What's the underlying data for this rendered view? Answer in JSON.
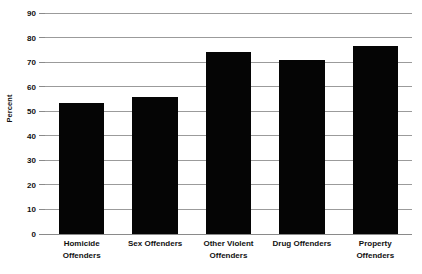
{
  "chart_data": {
    "type": "bar",
    "title": "",
    "xlabel": "",
    "ylabel": "Percent",
    "categories": [
      "Homicide Offenders",
      "Sex Offenders",
      "Other Violent Offenders",
      "Drug Offenders",
      "Property Offenders"
    ],
    "category_lines": [
      [
        "Homicide",
        "Offenders"
      ],
      [
        "Sex Offenders"
      ],
      [
        "Other Violent",
        "Offenders"
      ],
      [
        "Drug Offenders"
      ],
      [
        "Property",
        "Offenders"
      ]
    ],
    "values": [
      53.5,
      56,
      74,
      71,
      76.5
    ],
    "ylim": [
      0,
      90
    ],
    "ytick_step": 10,
    "ytick_labels": [
      "0",
      "10",
      "20",
      "30",
      "40",
      "50",
      "60",
      "70",
      "80",
      "90"
    ],
    "grid": true,
    "legend": null,
    "bar_color": "#050505",
    "gridline_color": "#9b9b9b",
    "background_color": "#ffffff"
  },
  "axis": {
    "y_title": "Percent"
  }
}
